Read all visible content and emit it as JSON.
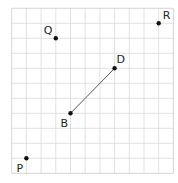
{
  "grid": {
    "cols": 11,
    "rows": 11,
    "origin_x": 11.7,
    "origin_y": 8.3,
    "cell_w": 14.7,
    "cell_h": 15,
    "line_color": "#d9d9d9",
    "border_color": "#cccccc"
  },
  "points": [
    {
      "label": "Q",
      "col": 3,
      "row": 2,
      "label_dx": -12,
      "label_dy": -4
    },
    {
      "label": "R",
      "col": 10,
      "row": 1,
      "label_dx": 4,
      "label_dy": -4
    },
    {
      "label": "D",
      "col": 7,
      "row": 4,
      "label_dx": 2,
      "label_dy": -5
    },
    {
      "label": "B",
      "col": 4,
      "row": 7,
      "label_dx": -10,
      "label_dy": 14
    },
    {
      "label": "P",
      "col": 1,
      "row": 10,
      "label_dx": -10,
      "label_dy": 14
    }
  ],
  "segments": [
    {
      "from": "B",
      "to": "D",
      "color": "#555555"
    }
  ],
  "point_color": "#111111"
}
